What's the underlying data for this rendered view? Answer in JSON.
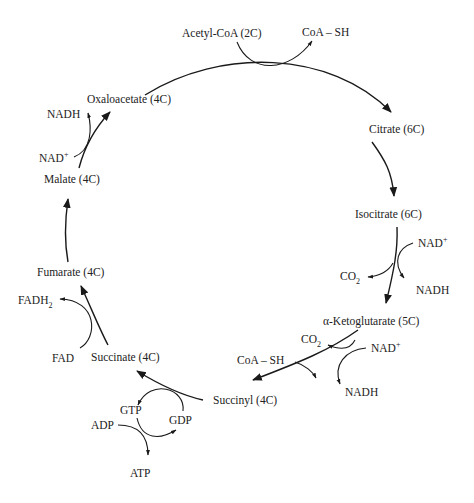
{
  "diagram": {
    "colors": {
      "stroke": "#1a1a1a",
      "text": "#222222",
      "background": "#ffffff"
    },
    "nodes": {
      "acetyl_coa": "Acetyl-CoA (2C)",
      "oxaloacetate": "Oxaloacetate (4C)",
      "citrate": "Citrate (6C)",
      "isocitrate": "Isocitrate (6C)",
      "alpha_ketoglutarate": "α-Ketoglutarate (5C)",
      "succinyl": "Succinyl (4C)",
      "succinate": "Succinate (4C)",
      "fumarate": "Fumarate (4C)",
      "malate": "Malate (4C)"
    },
    "cofactors": {
      "coa_sh_top": "CoA – SH",
      "nad_isocitrate": "NAD",
      "co2_isocitrate": "CO",
      "nadh_isocitrate": "NADH",
      "co2_akg": "CO",
      "nad_akg": "NAD",
      "coa_sh_akg": "CoA – SH",
      "nadh_akg": "NADH",
      "gtp": "GTP",
      "gdp": "GDP",
      "adp": "ADP",
      "atp": "ATP",
      "fadh2": "FADH",
      "fad": "FAD",
      "nadh_malate": "NADH",
      "nad_malate": "NAD"
    },
    "superscripts": {
      "plus": "+"
    },
    "subscripts": {
      "two": "2"
    }
  }
}
